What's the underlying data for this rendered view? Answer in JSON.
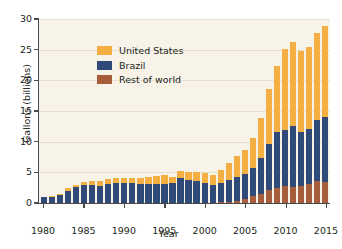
{
  "chart_data": {
    "type": "bar",
    "subtype": "stacked-bar",
    "title": "",
    "xlabel": "Year",
    "ylabel": "Gallons (billions)",
    "ylim": [
      0,
      30
    ],
    "yticks": [
      0,
      5,
      10,
      15,
      20,
      25,
      30
    ],
    "xticks": [
      1980,
      1985,
      1990,
      1995,
      2000,
      2005,
      2010,
      2015
    ],
    "xlim": [
      1980,
      2015
    ],
    "grid": true,
    "legend_position": "upper-left",
    "categories": [
      1980,
      1981,
      1982,
      1983,
      1984,
      1985,
      1986,
      1987,
      1988,
      1989,
      1990,
      1991,
      1992,
      1993,
      1994,
      1995,
      1996,
      1997,
      1998,
      1999,
      2000,
      2001,
      2002,
      2003,
      2004,
      2005,
      2006,
      2007,
      2008,
      2009,
      2010,
      2011,
      2012,
      2013,
      2014,
      2015
    ],
    "series": [
      {
        "name": "Rest of world",
        "color": "#a85d3a",
        "values": [
          0.0,
          0.0,
          0.0,
          0.0,
          0.0,
          0.0,
          0.0,
          0.0,
          0.0,
          0.0,
          0.0,
          0.0,
          0.0,
          0.0,
          0.0,
          0.0,
          0.0,
          0.0,
          0.0,
          0.0,
          0.0,
          0.0,
          0.1,
          0.2,
          0.3,
          0.6,
          1.2,
          1.5,
          2.1,
          2.4,
          2.7,
          2.6,
          2.8,
          3.1,
          3.6,
          3.5
        ]
      },
      {
        "name": "Brazil",
        "color": "#2f4a78",
        "values": [
          0.9,
          1.0,
          1.3,
          2.0,
          2.6,
          2.9,
          2.9,
          2.8,
          3.1,
          3.3,
          3.2,
          3.2,
          3.1,
          3.1,
          3.1,
          3.1,
          3.3,
          4.0,
          3.7,
          3.6,
          3.3,
          2.9,
          3.2,
          3.5,
          3.9,
          4.2,
          4.5,
          5.9,
          7.5,
          9.2,
          9.2,
          9.9,
          8.8,
          9.0,
          9.9,
          10.6
        ]
      },
      {
        "name": "United States",
        "color": "#f3af42",
        "values": [
          0.1,
          0.1,
          0.2,
          0.4,
          0.4,
          0.6,
          0.7,
          0.8,
          0.8,
          0.8,
          0.9,
          0.9,
          1.0,
          1.1,
          1.3,
          1.4,
          1.0,
          1.3,
          1.4,
          1.5,
          1.6,
          1.7,
          2.1,
          2.8,
          3.4,
          3.9,
          4.9,
          6.5,
          9.0,
          10.8,
          13.2,
          13.8,
          13.2,
          13.3,
          14.3,
          14.8
        ]
      }
    ]
  },
  "legend": {
    "items": [
      {
        "label": "United States",
        "color": "#f3af42"
      },
      {
        "label": "Brazil",
        "color": "#2f4a78"
      },
      {
        "label": "Rest of world",
        "color": "#a85d3a"
      }
    ]
  },
  "colors": {
    "plot_background": "#f7f3e9",
    "page_background": "#ffffff",
    "axis": "#4a4a4a",
    "gridline": "#e7e0d0",
    "text": "#231f20"
  }
}
